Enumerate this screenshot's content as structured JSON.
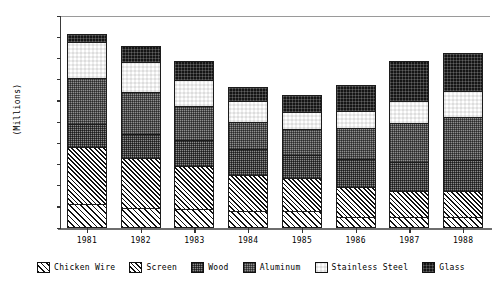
{
  "chart_data": {
    "type": "bar",
    "variant": "stacked",
    "title": "",
    "subtitle": "",
    "xlabel": "",
    "ylabel": "(Millions)",
    "ylim": [
      0,
      2
    ],
    "ytick_step": 0.2,
    "ytick_labels": [
      "2",
      "1.8",
      "1.6",
      "1.4",
      "1.2",
      "1",
      "0.8",
      "0.6",
      "0.4",
      "0.2",
      "0"
    ],
    "ytick_values": [
      2,
      1.8,
      1.6,
      1.4,
      1.2,
      1,
      0.8,
      0.6,
      0.4,
      0.2,
      0
    ],
    "grid": false,
    "legend_position": "bottom",
    "categories": [
      "1981",
      "1982",
      "1983",
      "1984",
      "1985",
      "1986",
      "1987",
      "1988"
    ],
    "series": [
      {
        "name": "Chicken Wire",
        "pattern": "diagonal-hatch-right",
        "color": "#ffffff",
        "values": [
          0.23,
          0.19,
          0.18,
          0.16,
          0.16,
          0.1,
          0.1,
          0.1
        ]
      },
      {
        "name": "Screen",
        "pattern": "diagonal-hatch-left",
        "color": "#ffffff",
        "values": [
          0.54,
          0.48,
          0.41,
          0.35,
          0.32,
          0.3,
          0.26,
          0.26
        ]
      },
      {
        "name": "Wood",
        "pattern": "dense-speckle",
        "color": "#8a8a8a",
        "values": [
          0.23,
          0.24,
          0.26,
          0.25,
          0.23,
          0.27,
          0.28,
          0.3
        ]
      },
      {
        "name": "Aluminum",
        "pattern": "medium-speckle",
        "color": "#8f8f8f",
        "values": [
          0.44,
          0.4,
          0.33,
          0.27,
          0.25,
          0.3,
          0.38,
          0.42
        ]
      },
      {
        "name": "Stainless Steel",
        "pattern": "checkerboard",
        "color": "#ffffff",
        "values": [
          0.35,
          0.29,
          0.25,
          0.21,
          0.17,
          0.17,
          0.22,
          0.25
        ]
      },
      {
        "name": "Glass",
        "pattern": "solid-dark",
        "color": "#151515",
        "values": [
          0.09,
          0.16,
          0.19,
          0.14,
          0.17,
          0.26,
          0.38,
          0.37
        ]
      }
    ],
    "totals": [
      1.88,
      1.76,
      1.62,
      1.38,
      1.3,
      1.4,
      1.62,
      1.7
    ]
  }
}
